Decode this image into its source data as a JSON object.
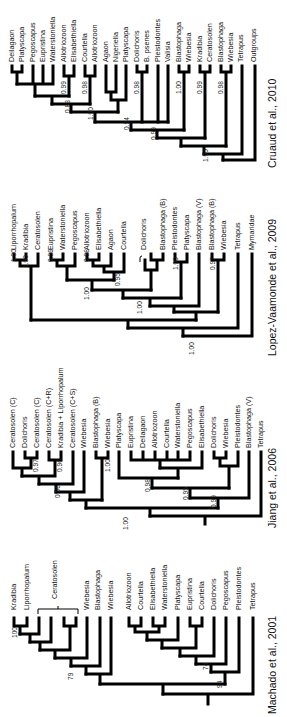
{
  "figure": {
    "panels": [
      {
        "caption": "Cruaud et al., 2010",
        "leaves": [
          "Deilagaon",
          "Platyscapa",
          "Pegoscapus",
          "Eupristina",
          "Waterstoniella",
          "Allotriozoon",
          "Elisabethiella",
          "Courtella",
          "Allotriozoon",
          "Agaon",
          "Nigeriella",
          "Platyscapa",
          "Dolichoris",
          "B. psenes",
          "Pleistodontes",
          "Valisia",
          "Blastophaga",
          "Wiebesia",
          "Kradibia",
          "Ceratosolen",
          "Blastophaga",
          "Wiebesia",
          "Tetrapus",
          "Outgroups"
        ],
        "supports": [
          "0.99",
          "0.83",
          "0.98",
          "1.00",
          "0.98",
          "0.94",
          "1.00",
          "0.99",
          "0.99",
          "0.98",
          "1.00"
        ]
      },
      {
        "caption": "Lopez-Vaamonde et al., 2009",
        "leaves": [
          "Liporrhopalum",
          "Kradibia",
          "Ceratosolen",
          "Eupristina",
          "Waterstoniella",
          "Pegoscapus",
          "Allotriozoon",
          "Elisabethiella",
          "Agaon",
          "Courtella",
          "Dolichoris",
          "Blastophaga (B)",
          "Pleistodontes",
          "Platyscapa",
          "Blastophaga (V)",
          "Blastophaga (B)",
          "Wiebesia",
          "Tetrapus",
          "Mymaridae"
        ],
        "supports": [
          "1.00",
          "1.00",
          "0.99",
          "0.98",
          "0.95",
          "1.00",
          "1.00",
          "1.00",
          "0.97",
          "1.00"
        ]
      },
      {
        "caption": "Jiang et al., 2006",
        "leaves": [
          "Ceratosolen (C)",
          "Dolichoris",
          "Ceratosolen (C)",
          "Ceratosolen (C+R)",
          "Kradibia + Liporrhopalum",
          "Ceratosolen (C+S)",
          "Wiebesia",
          "Blastophaga (B)",
          "Wiebesia",
          "Platyscapa",
          "Eupristina",
          "Deilagaon",
          "Allotriozoon",
          "Courtella",
          "Waterstoniella",
          "Pegoscapus",
          "Elisabethiella",
          "Dolichoris",
          "Wiebesia",
          "Pleistodontes",
          "Blastophaga (V)",
          "Tetrapus"
        ],
        "supports": [
          "0.97",
          "0.96",
          "0.96",
          "1.00",
          "0.98",
          "0.95",
          "0.99",
          "1.00"
        ]
      },
      {
        "caption": "Machado et al., 2001",
        "leaves": [
          "Kradibia",
          "Liporrhopalum",
          "Ceratosolen",
          "Wiebesia",
          "Blastophaga",
          "Wiebesia",
          "Allotriozoon",
          "Courtella",
          "Elisabethiella",
          "Waterstoniella",
          "Platyscapa",
          "Eupristina",
          "Courtella",
          "Dolichoris",
          "Pegoscapus",
          "Pleistodontes",
          "Tetrapus"
        ],
        "bracket_label": "Ceratosolen",
        "supports": [
          "100",
          "79",
          "74",
          "94"
        ]
      }
    ]
  }
}
